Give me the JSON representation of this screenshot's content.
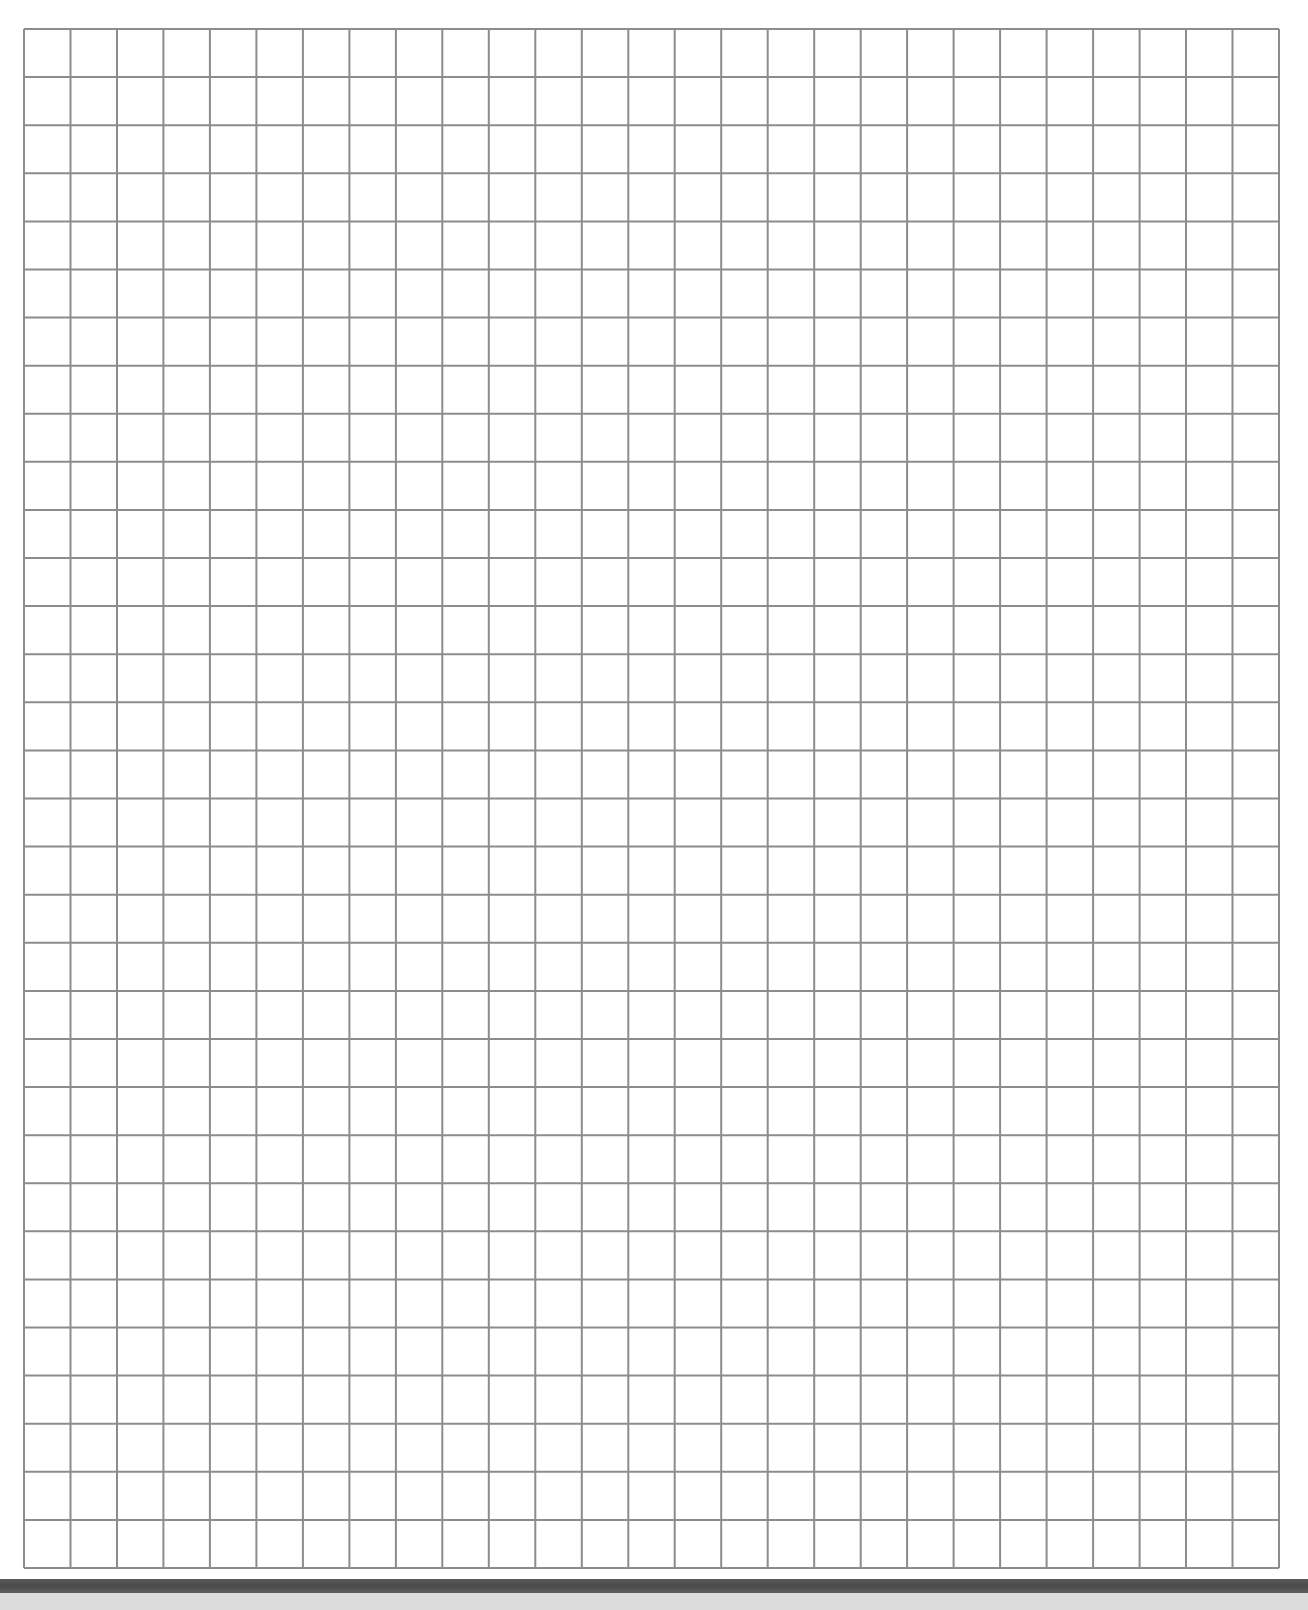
{
  "document": {
    "type": "graph-paper",
    "grid": {
      "columns": 27,
      "rows": 32,
      "line_color": "#8c8c8c",
      "paper_color": "#ffffff"
    },
    "scanner": {
      "edge_color": "#505050",
      "bed_color": "#dcdcdc"
    }
  }
}
